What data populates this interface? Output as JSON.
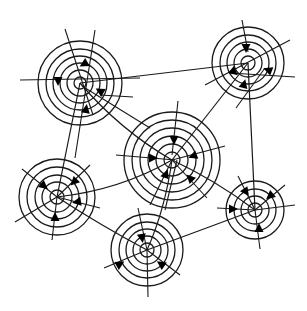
{
  "diagram": {
    "type": "network-of-concentric-circles",
    "colors": {
      "line": "#1a1a1a",
      "arrow": "#000000",
      "background": "#ffffff"
    },
    "nodes": [
      {
        "id": "A",
        "cx": 80,
        "cy": 83,
        "rings": [
          6,
          13,
          20,
          27,
          34,
          42
        ],
        "spokes": [
          [
            65,
            29,
            93,
            115
          ],
          [
            95,
            30,
            75,
            158
          ],
          [
            20,
            80,
            140,
            78
          ],
          [
            100,
            95,
            133,
            97
          ],
          [
            82,
            86,
            150,
            128
          ]
        ],
        "arrows": [
          [
            84,
            64,
            150
          ],
          [
            58,
            81,
            90
          ],
          [
            100,
            91,
            210
          ],
          [
            86,
            109,
            280
          ]
        ]
      },
      {
        "id": "B",
        "cx": 248,
        "cy": 63,
        "rings": [
          7,
          14,
          21,
          28,
          36
        ],
        "spokes": [
          [
            242,
            20,
            248,
            52
          ],
          [
            290,
            40,
            205,
            85
          ],
          [
            230,
            73,
            295,
            77
          ],
          [
            265,
            68,
            236,
            108
          ]
        ],
        "arrows": [
          [
            246,
            48,
            90
          ],
          [
            234,
            72,
            40
          ],
          [
            268,
            70,
            200
          ],
          [
            244,
            84,
            285
          ]
        ]
      },
      {
        "id": "C",
        "cx": 172,
        "cy": 160,
        "rings": [
          8,
          16,
          24,
          32,
          40,
          48
        ],
        "spokes": [
          [
            178,
            101,
            172,
            155
          ],
          [
            116,
            155,
            175,
            160
          ],
          [
            225,
            146,
            172,
            160
          ],
          [
            165,
            210,
            177,
            160
          ],
          [
            207,
            198,
            172,
            160
          ],
          [
            150,
            205,
            172,
            160
          ]
        ],
        "arrows": [
          [
            174,
            140,
            90
          ],
          [
            153,
            158,
            0
          ],
          [
            193,
            156,
            160
          ],
          [
            166,
            174,
            290
          ],
          [
            190,
            178,
            225
          ]
        ]
      },
      {
        "id": "D",
        "cx": 57,
        "cy": 197,
        "rings": [
          7,
          15,
          22,
          30,
          38
        ],
        "spokes": [
          [
            22,
            169,
            57,
            197
          ],
          [
            90,
            165,
            57,
            197
          ],
          [
            100,
            208,
            57,
            197
          ],
          [
            52,
            240,
            57,
            197
          ],
          [
            15,
            222,
            57,
            197
          ]
        ],
        "arrows": [
          [
            44,
            186,
            40
          ],
          [
            74,
            182,
            135
          ],
          [
            77,
            202,
            170
          ],
          [
            55,
            217,
            270
          ]
        ]
      },
      {
        "id": "E",
        "cx": 147,
        "cy": 250,
        "rings": [
          7,
          14,
          21,
          28,
          36
        ],
        "spokes": [
          [
            138,
            208,
            147,
            250
          ],
          [
            104,
            268,
            147,
            250
          ],
          [
            180,
            275,
            147,
            250
          ],
          [
            148,
            297,
            147,
            250
          ]
        ],
        "arrows": [
          [
            142,
            238,
            80
          ],
          [
            120,
            264,
            330
          ],
          [
            161,
            264,
            215
          ]
        ]
      },
      {
        "id": "F",
        "cx": 255,
        "cy": 210,
        "rings": [
          7,
          14,
          21,
          29
        ],
        "spokes": [
          [
            238,
            176,
            255,
            210
          ],
          [
            285,
            185,
            255,
            210
          ],
          [
            217,
            208,
            255,
            210
          ],
          [
            260,
            249,
            255,
            210
          ],
          [
            295,
            205,
            255,
            210
          ]
        ],
        "arrows": [
          [
            246,
            192,
            55
          ],
          [
            270,
            196,
            140
          ],
          [
            233,
            209,
            0
          ],
          [
            259,
            228,
            270
          ]
        ]
      }
    ],
    "edges": [
      {
        "from": "A",
        "to": "B",
        "path": "M80 83 L248 63"
      },
      {
        "from": "A",
        "to": "C",
        "path": "M80 83 Q120 130 172 160"
      },
      {
        "from": "A",
        "to": "D",
        "path": "M80 83 L57 197"
      },
      {
        "from": "B",
        "to": "C",
        "path": "M248 63 L172 160"
      },
      {
        "from": "B",
        "to": "F",
        "path": "M248 63 L255 210"
      },
      {
        "from": "C",
        "to": "D",
        "path": "M57 197 Q120 190 172 160"
      },
      {
        "from": "C",
        "to": "E",
        "path": "M172 160 Q165 210 147 250"
      },
      {
        "from": "C",
        "to": "F",
        "path": "M172 160 Q215 180 255 210"
      },
      {
        "from": "D",
        "to": "E",
        "path": "M57 197 Q100 225 147 250"
      },
      {
        "from": "E",
        "to": "F",
        "path": "M147 250 L255 210"
      }
    ]
  }
}
